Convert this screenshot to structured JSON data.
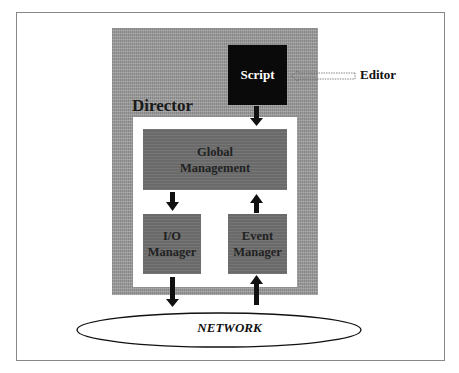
{
  "diagram": {
    "title": "",
    "nodes": {
      "director": {
        "label": "Director"
      },
      "script": {
        "label": "Script"
      },
      "editor": {
        "label": "Editor"
      },
      "global_management": {
        "label": "Global Management",
        "line1": "Global",
        "line2": "Management"
      },
      "io_manager": {
        "label": "I/O Manager",
        "line1": "I/O",
        "line2": "Manager"
      },
      "event_manager": {
        "label": "Event Manager",
        "line1": "Event",
        "line2": "Manager"
      },
      "network": {
        "label": "NETWORK"
      }
    },
    "edges": [
      {
        "from": "editor",
        "to": "script",
        "style": "dashed-outline"
      },
      {
        "from": "script",
        "to": "global_management",
        "style": "solid"
      },
      {
        "from": "global_management",
        "to": "io_manager",
        "style": "solid"
      },
      {
        "from": "event_manager",
        "to": "global_management",
        "style": "solid"
      },
      {
        "from": "io_manager",
        "to": "network",
        "style": "solid"
      },
      {
        "from": "network",
        "to": "event_manager",
        "style": "solid"
      }
    ],
    "colors": {
      "director_bg": "#9a9a9a",
      "script_bg": "#0a0a0a",
      "module_bg": "#6a6a6a",
      "inner_bg": "#ffffff",
      "frame_border": "#888888"
    }
  }
}
